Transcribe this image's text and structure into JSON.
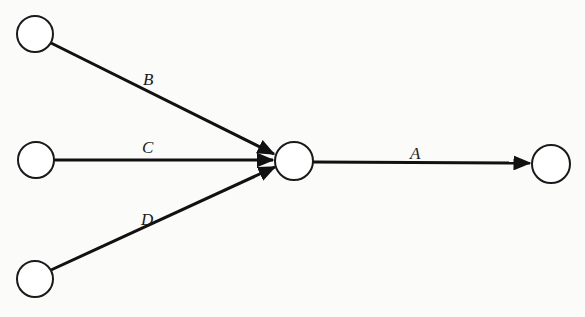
{
  "diagram": {
    "type": "activity-network",
    "nodes": [
      {
        "id": "n1",
        "cx": 35,
        "cy": 34,
        "r": 18
      },
      {
        "id": "n2",
        "cx": 36,
        "cy": 160,
        "r": 18
      },
      {
        "id": "n3",
        "cx": 35,
        "cy": 279,
        "r": 18
      },
      {
        "id": "n4",
        "cx": 294,
        "cy": 161,
        "r": 19
      },
      {
        "id": "n5",
        "cx": 551,
        "cy": 164,
        "r": 19
      }
    ],
    "edges": [
      {
        "id": "B",
        "from": "n1",
        "to": "n4",
        "label": "B",
        "label_x": 143,
        "label_y": 85
      },
      {
        "id": "C",
        "from": "n2",
        "to": "n4",
        "label": "C",
        "label_x": 142,
        "label_y": 153
      },
      {
        "id": "D",
        "from": "n3",
        "to": "n4",
        "label": "D",
        "label_x": 141,
        "label_y": 225
      },
      {
        "id": "A",
        "from": "n4",
        "to": "n5",
        "label": "A",
        "label_x": 410,
        "label_y": 159
      }
    ],
    "colors": {
      "line": "#111111",
      "background": "#fbfbfa"
    }
  }
}
